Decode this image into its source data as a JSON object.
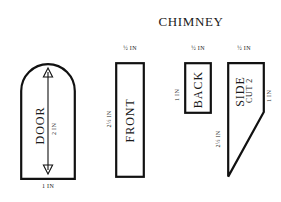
{
  "diagram": {
    "title": "CHIMNEY",
    "background_color": "#ffffff",
    "ink_color": "#111111",
    "type": "craft-pattern-cutting-template",
    "units": "IN"
  },
  "pieces": [
    {
      "id": "door",
      "label": "DOOR",
      "shape": "arch",
      "cut_note": "",
      "dimensions": {
        "height_label": "2 IN",
        "width_label": "1 IN"
      },
      "arrow": "double-headed-vertical"
    },
    {
      "id": "front",
      "label": "FRONT",
      "shape": "rectangle",
      "cut_note": "",
      "dimensions": {
        "width_label": "½ IN",
        "height_label": "2½ IN"
      }
    },
    {
      "id": "back",
      "label": "BACK",
      "shape": "rectangle",
      "cut_note": "",
      "dimensions": {
        "width_label": "½ IN",
        "height_label": "1 IN"
      }
    },
    {
      "id": "side",
      "label": "SIDE",
      "shape": "right-trapezoid-point",
      "cut_note": "CUT 2",
      "dimensions": {
        "width_label": "½ IN",
        "right_height_label": "1 IN",
        "left_height_label": "2½ IN"
      }
    }
  ]
}
